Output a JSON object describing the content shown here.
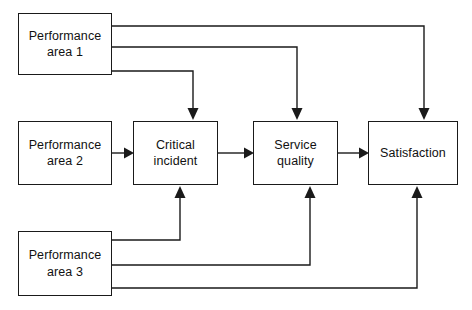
{
  "diagram": {
    "type": "flow-diagram",
    "canvas": {
      "width": 472,
      "height": 310
    },
    "style": {
      "background_color": "#ffffff",
      "line_color": "#1a1a1a",
      "box_border_color": "#1a1a1a",
      "box_fill_color": "#ffffff",
      "text_color": "#111111"
    },
    "nodes": [
      {
        "id": "performance-area-1",
        "label": "Performance\narea 1",
        "x": 18,
        "y": 13,
        "width": 94,
        "height": 62
      },
      {
        "id": "performance-area-2",
        "label": "Performance\narea 2",
        "x": 18,
        "y": 121,
        "width": 94,
        "height": 64
      },
      {
        "id": "performance-area-3",
        "label": "Performance\narea 3",
        "x": 18,
        "y": 231,
        "width": 94,
        "height": 65
      },
      {
        "id": "critical-incident",
        "label": "Critical\nincident",
        "x": 133,
        "y": 121,
        "width": 85,
        "height": 64
      },
      {
        "id": "service-quality",
        "label": "Service\nquality",
        "x": 253,
        "y": 121,
        "width": 85,
        "height": 64
      },
      {
        "id": "satisfaction",
        "label": "Satisfaction",
        "x": 368,
        "y": 121,
        "width": 90,
        "height": 64
      }
    ],
    "edges": [
      {
        "id": "edge-pa1-to-satisfaction",
        "from": "performance-area-1",
        "to": "satisfaction",
        "path": "M112,26 L424,26 L424,118",
        "arrow_at": {
          "x": 424,
          "y": 121,
          "direction": "down"
        }
      },
      {
        "id": "edge-pa1-to-service-quality",
        "from": "performance-area-1",
        "to": "service-quality",
        "path": "M112,47 L297,47 L297,118",
        "arrow_at": {
          "x": 297,
          "y": 121,
          "direction": "down"
        }
      },
      {
        "id": "edge-pa1-to-critical-incident",
        "from": "performance-area-1",
        "to": "critical-incident",
        "path": "M112,71 L193,71 L193,118",
        "arrow_at": {
          "x": 193,
          "y": 121,
          "direction": "down"
        }
      },
      {
        "id": "edge-pa2-to-critical-incident",
        "from": "performance-area-2",
        "to": "critical-incident",
        "path": "M112,153 L130,153",
        "arrow_at": {
          "x": 133,
          "y": 153,
          "direction": "right"
        }
      },
      {
        "id": "edge-critical-incident-to-service-quality",
        "from": "critical-incident",
        "to": "service-quality",
        "path": "M218,153 L250,153",
        "arrow_at": {
          "x": 253,
          "y": 153,
          "direction": "right"
        }
      },
      {
        "id": "edge-service-quality-to-satisfaction",
        "from": "service-quality",
        "to": "satisfaction",
        "path": "M338,153 L365,153",
        "arrow_at": {
          "x": 368,
          "y": 153,
          "direction": "right"
        }
      },
      {
        "id": "edge-pa3-to-critical-incident",
        "from": "performance-area-3",
        "to": "critical-incident",
        "path": "M112,240 L180,240 L180,188",
        "arrow_at": {
          "x": 180,
          "y": 185,
          "direction": "up"
        }
      },
      {
        "id": "edge-pa3-to-service-quality",
        "from": "performance-area-3",
        "to": "service-quality",
        "path": "M112,265 L310,265 L310,188",
        "arrow_at": {
          "x": 310,
          "y": 185,
          "direction": "up"
        }
      },
      {
        "id": "edge-pa3-to-satisfaction",
        "from": "performance-area-3",
        "to": "satisfaction",
        "path": "M112,288 L417,288 L417,188",
        "arrow_at": {
          "x": 417,
          "y": 185,
          "direction": "up"
        }
      }
    ]
  }
}
